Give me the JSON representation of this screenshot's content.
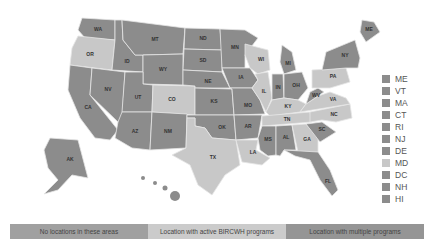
{
  "colors": {
    "none": "#9a9a9a",
    "active": "#c8c8c8",
    "multiple": "#8c8c8c",
    "border": "#e6e6e6"
  },
  "legend_bar": [
    {
      "label": "No locations in these areas",
      "color": "#a0a0a0"
    },
    {
      "label": "Location with active BIRCWH programs",
      "color": "#cbcbcb"
    },
    {
      "label": "Location with multiple programs",
      "color": "#959595"
    }
  ],
  "small_states_legend": [
    {
      "code": "ME",
      "status": "multiple"
    },
    {
      "code": "VT",
      "status": "multiple"
    },
    {
      "code": "MA",
      "status": "multiple"
    },
    {
      "code": "CT",
      "status": "multiple"
    },
    {
      "code": "RI",
      "status": "multiple"
    },
    {
      "code": "NJ",
      "status": "multiple"
    },
    {
      "code": "DE",
      "status": "multiple"
    },
    {
      "code": "MD",
      "status": "active"
    },
    {
      "code": "DC",
      "status": "multiple"
    },
    {
      "code": "NH",
      "status": "multiple"
    },
    {
      "code": "HI",
      "status": "multiple"
    }
  ],
  "states": [
    {
      "code": "WA",
      "status": "multiple",
      "points": "82,18 115,20 115,40 85,38 78,30",
      "lx": 98,
      "ly": 30
    },
    {
      "code": "OR",
      "status": "active",
      "points": "78,36 115,40 112,70 70,65 72,48",
      "lx": 90,
      "ly": 55
    },
    {
      "code": "CA",
      "status": "multiple",
      "points": "70,65 92,68 90,95 118,130 110,140 95,138 80,118 68,90",
      "lx": 88,
      "ly": 108
    },
    {
      "code": "ID",
      "status": "multiple",
      "points": "115,20 122,20 123,40 135,55 143,55 143,72 112,70 115,40",
      "lx": 127,
      "ly": 62
    },
    {
      "code": "NV",
      "status": "multiple",
      "points": "92,68 125,72 122,118 118,122 90,95",
      "lx": 108,
      "ly": 90
    },
    {
      "code": "MT",
      "status": "multiple",
      "points": "122,20 185,28 183,54 143,55 135,55 123,40",
      "lx": 155,
      "ly": 40
    },
    {
      "code": "WY",
      "status": "multiple",
      "points": "143,55 183,54 183,85 143,84",
      "lx": 163,
      "ly": 70
    },
    {
      "code": "UT",
      "status": "multiple",
      "points": "125,72 143,72 143,84 153,85 152,112 122,112",
      "lx": 138,
      "ly": 98
    },
    {
      "code": "AZ",
      "status": "multiple",
      "points": "122,112 152,112 150,150 132,148 115,138 118,122",
      "lx": 135,
      "ly": 132
    },
    {
      "code": "CO",
      "status": "active",
      "points": "153,85 195,86 195,115 152,112",
      "lx": 172,
      "ly": 100
    },
    {
      "code": "NM",
      "status": "multiple",
      "points": "152,112 187,114 186,148 150,150",
      "lx": 168,
      "ly": 132
    },
    {
      "code": "ND",
      "status": "multiple",
      "points": "185,28 220,29 222,50 184,49",
      "lx": 203,
      "ly": 39
    },
    {
      "code": "SD",
      "status": "multiple",
      "points": "184,49 222,50 222,72 183,70",
      "lx": 203,
      "ly": 61
    },
    {
      "code": "NE",
      "status": "multiple",
      "points": "183,70 222,72 230,88 195,88 195,86 183,85",
      "lx": 208,
      "ly": 82
    },
    {
      "code": "KS",
      "status": "multiple",
      "points": "195,88 232,89 234,115 195,115",
      "lx": 214,
      "ly": 102
    },
    {
      "code": "OK",
      "status": "multiple",
      "points": "187,115 234,115 236,140 212,138 205,128 195,126 195,118 187,118",
      "lx": 222,
      "ly": 128
    },
    {
      "code": "TX",
      "status": "active",
      "points": "187,118 195,118 195,126 205,128 212,138 236,140 240,165 225,175 212,195 198,185 190,165 172,155 186,148",
      "lx": 213,
      "ly": 158
    },
    {
      "code": "MN",
      "status": "multiple",
      "points": "220,29 245,30 258,38 245,55 245,68 222,68",
      "lx": 235,
      "ly": 48
    },
    {
      "code": "IA",
      "status": "multiple",
      "points": "222,68 250,68 258,80 252,88 230,88",
      "lx": 241,
      "ly": 78
    },
    {
      "code": "MO",
      "status": "multiple",
      "points": "230,88 252,88 260,100 265,114 234,115 232,89",
      "lx": 248,
      "ly": 106
    },
    {
      "code": "AR",
      "status": "multiple",
      "points": "234,115 262,115 258,138 236,140",
      "lx": 248,
      "ly": 127
    },
    {
      "code": "LA",
      "status": "active",
      "points": "236,140 258,140 256,150 270,158 262,165 242,162",
      "lx": 253,
      "ly": 153
    },
    {
      "code": "WI",
      "status": "active",
      "points": "245,44 268,50 270,70 258,74 250,68 245,55",
      "lx": 261,
      "ly": 60
    },
    {
      "code": "IL",
      "status": "active",
      "points": "255,74 268,72 272,98 266,112 260,100 252,88 258,80",
      "lx": 264,
      "ly": 92
    },
    {
      "code": "MI",
      "status": "multiple",
      "points": "282,45 292,52 296,70 284,74 280,62",
      "lx": 288,
      "ly": 64
    },
    {
      "code": "IN",
      "status": "multiple",
      "points": "272,74 283,74 284,98 272,100",
      "lx": 278,
      "ly": 88
    },
    {
      "code": "OH",
      "status": "multiple",
      "points": "284,74 302,72 308,88 298,100 284,98",
      "lx": 296,
      "ly": 86
    },
    {
      "code": "KY",
      "status": "active",
      "points": "266,112 272,100 284,98 298,100 306,104 300,112 270,116",
      "lx": 288,
      "ly": 107
    },
    {
      "code": "TN",
      "status": "active",
      "points": "262,116 310,112 312,122 262,126",
      "lx": 287,
      "ly": 120
    },
    {
      "code": "MS",
      "status": "multiple",
      "points": "262,126 276,126 276,155 268,156 260,150 258,138",
      "lx": 268,
      "ly": 140
    },
    {
      "code": "AL",
      "status": "multiple",
      "points": "276,126 292,125 296,150 284,150 280,156 276,155",
      "lx": 286,
      "ly": 138
    },
    {
      "code": "GA",
      "status": "active",
      "points": "292,125 306,124 318,138 318,152 298,152",
      "lx": 307,
      "ly": 140
    },
    {
      "code": "FL",
      "status": "multiple",
      "points": "284,150 318,152 330,170 338,190 332,196 320,180 310,160 295,156",
      "lx": 328,
      "ly": 182
    },
    {
      "code": "SC",
      "status": "multiple",
      "points": "306,124 322,122 336,132 320,142",
      "lx": 322,
      "ly": 130
    },
    {
      "code": "NC",
      "status": "active",
      "points": "310,112 350,104 352,118 336,122 322,120 310,122",
      "lx": 334,
      "ly": 115
    },
    {
      "code": "VA",
      "status": "active",
      "points": "300,112 306,104 318,96 330,92 346,98 350,104",
      "lx": 333,
      "ly": 100
    },
    {
      "code": "WV",
      "status": "multiple",
      "points": "306,104 310,92 318,88 324,92 318,96",
      "lx": 316,
      "ly": 96
    },
    {
      "code": "PA",
      "status": "active",
      "points": "312,70 346,68 350,82 330,88 312,88",
      "lx": 333,
      "ly": 77
    },
    {
      "code": "NY",
      "status": "multiple",
      "points": "326,52 355,40 360,58 358,68 346,68 322,70",
      "lx": 345,
      "ly": 56
    },
    {
      "code": "ME",
      "status": "multiple",
      "points": "362,20 374,22 380,32 366,42 360,32",
      "lx": 369,
      "ly": 30
    }
  ],
  "alaska": {
    "code": "AK",
    "status": "multiple",
    "points": "50,138 78,140 88,178 72,175 58,190 44,194 58,180 48,168 44,150",
    "lx": 70,
    "ly": 160
  },
  "hawaii": {
    "code": "HI",
    "status": "multiple",
    "lx": 175,
    "ly": 200
  }
}
